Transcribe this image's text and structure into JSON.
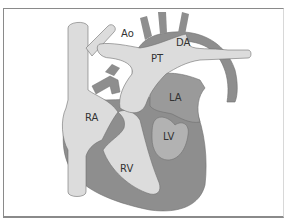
{
  "diagram": {
    "type": "anatomical heart diagram",
    "colors": {
      "background": "#ffffff",
      "frame": "#8a8a8a",
      "light_structure": "#dcdcdc",
      "dark_structure": "#8e8e8e",
      "outline": "#6e6e6e",
      "label": "#333333"
    },
    "labels": {
      "ao": "Ao",
      "da": "DA",
      "pt": "PT",
      "ra": "RA",
      "la": "LA",
      "lv": "LV",
      "rv": "RV"
    }
  }
}
